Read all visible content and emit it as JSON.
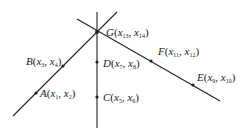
{
  "diagram": {
    "lines": [
      {
        "name": "line-AB",
        "x1": 13,
        "y1": 116,
        "x2": 117,
        "y2": 12,
        "points": [
          "A",
          "B",
          "G"
        ]
      },
      {
        "name": "line-CD",
        "x1": 97,
        "y1": 12,
        "x2": 97,
        "y2": 128,
        "points": [
          "C",
          "D",
          "G"
        ]
      },
      {
        "name": "line-EF",
        "x1": 77,
        "y1": 19,
        "x2": 220,
        "y2": 101,
        "points": [
          "G",
          "F",
          "E"
        ]
      }
    ],
    "points": [
      {
        "id": "A",
        "x": 36,
        "y": 93,
        "label": {
          "name": "A",
          "i": "1",
          "j": "2",
          "lx": 40,
          "ly": 88
        }
      },
      {
        "id": "B",
        "x": 63,
        "y": 66,
        "label": {
          "name": "B",
          "i": "3",
          "j": "4",
          "lx": 26,
          "ly": 56
        }
      },
      {
        "id": "C",
        "x": 97,
        "y": 97,
        "label": {
          "name": "C",
          "i": "5",
          "j": "6",
          "lx": 103,
          "ly": 92
        }
      },
      {
        "id": "D",
        "x": 97,
        "y": 62,
        "label": {
          "name": "D",
          "i": "7",
          "j": "8",
          "lx": 103,
          "ly": 58
        }
      },
      {
        "id": "E",
        "x": 193,
        "y": 85,
        "label": {
          "name": "E",
          "i": "9",
          "j": "10",
          "lx": 197,
          "ly": 72
        }
      },
      {
        "id": "F",
        "x": 151,
        "y": 61,
        "label": {
          "name": "F",
          "i": "11",
          "j": "12",
          "lx": 158,
          "ly": 46
        }
      },
      {
        "id": "G",
        "x": 97,
        "y": 32,
        "label": {
          "name": "G",
          "i": "13",
          "j": "14",
          "lx": 106,
          "ly": 27
        }
      }
    ],
    "colors": {
      "line": "#222222",
      "text": "#222222"
    }
  }
}
